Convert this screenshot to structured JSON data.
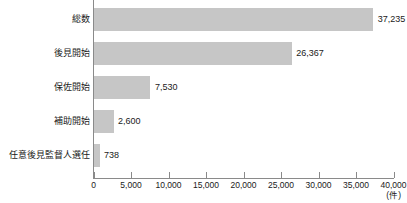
{
  "chart_data": {
    "type": "bar",
    "orientation": "horizontal",
    "title": "",
    "xlabel": "(件)",
    "ylabel": "",
    "categories": [
      "総数",
      "後見開始",
      "保佐開始",
      "補助開始",
      "任意後見監督人選任"
    ],
    "values": [
      37235,
      26367,
      7530,
      2600,
      738
    ],
    "value_labels": [
      "37,235",
      "26,367",
      "7,530",
      "2,600",
      "738"
    ],
    "xlim": [
      0,
      40000
    ],
    "xticks": [
      0,
      5000,
      10000,
      15000,
      20000,
      25000,
      30000,
      35000,
      40000
    ],
    "xtick_labels": [
      "0",
      "5,000",
      "10,000",
      "15,000",
      "20,000",
      "25,000",
      "30,000",
      "35,000",
      "40,000"
    ],
    "grid": false,
    "legend": false,
    "bar_color": "#c6c6c6",
    "axis_color": "#8a8a8a",
    "text_color": "#1a1a1a",
    "background": "#ffffff"
  }
}
